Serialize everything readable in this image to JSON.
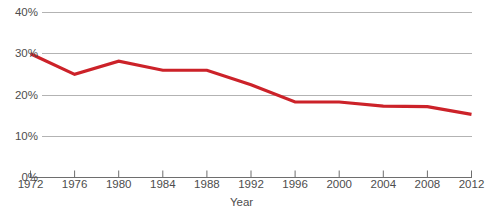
{
  "chart_data": {
    "type": "line",
    "title": "",
    "subtitle": "",
    "xlabel": "Year",
    "ylabel": "",
    "x": [
      1972,
      1976,
      1980,
      1984,
      1988,
      1992,
      1996,
      2000,
      2004,
      2008,
      2012
    ],
    "categories": [
      "1972",
      "1976",
      "1980",
      "1984",
      "1988",
      "1992",
      "1996",
      "2000",
      "2004",
      "2008",
      "2012"
    ],
    "values": [
      30.0,
      25.0,
      28.2,
      26.0,
      26.0,
      22.5,
      18.3,
      18.3,
      17.3,
      17.2,
      15.3
    ],
    "series": [
      {
        "name": "",
        "color": "#cc2229",
        "values": [
          30.0,
          25.0,
          28.2,
          26.0,
          26.0,
          22.5,
          18.3,
          18.3,
          17.3,
          17.2,
          15.3
        ]
      }
    ],
    "xlim": [
      1972,
      2012
    ],
    "ylim": [
      0,
      40
    ],
    "y_ticks": [
      0,
      10,
      20,
      30,
      40
    ],
    "y_tick_labels": [
      "0%",
      "10%",
      "20%",
      "30%",
      "40%"
    ],
    "x_ticks": [
      1972,
      1976,
      1980,
      1984,
      1988,
      1992,
      1996,
      2000,
      2004,
      2008,
      2012
    ],
    "x_tick_labels": [
      "1972",
      "1976",
      "1980",
      "1984",
      "1988",
      "1992",
      "1996",
      "2000",
      "2004",
      "2008",
      "2012"
    ],
    "grid": "horizontal",
    "gridline_color": "#b3b3b3",
    "axis_color": "#6e6e6e",
    "legend": null,
    "legend_position": "none",
    "annotations": []
  },
  "axes": {
    "x_axis_title": "Year"
  }
}
